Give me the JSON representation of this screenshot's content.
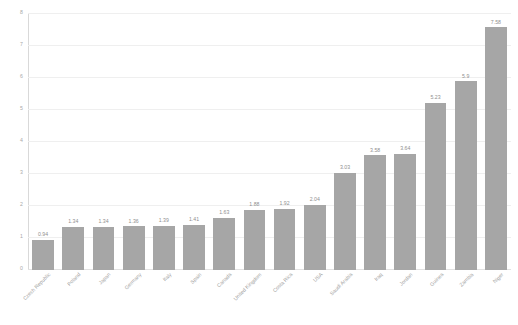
{
  "chart_data": {
    "type": "bar",
    "title": "",
    "subtitle": "",
    "xlabel": "",
    "ylabel": "",
    "ylim": [
      0,
      8
    ],
    "yticks": [
      "0",
      "1",
      "2",
      "3",
      "4",
      "5",
      "6",
      "7",
      "8"
    ],
    "grid": true,
    "legend": "none",
    "bar_color": "#a6a6a6",
    "categories": [
      "Czech Republic",
      "Poland",
      "Japan",
      "Germany",
      "Italy",
      "Spain",
      "Canada",
      "United Kingdom",
      "Costa Rica",
      "USA",
      "Saudi Arabia",
      "Iraq",
      "Jordan",
      "Guinea",
      "Zambia",
      "Niger"
    ],
    "values": [
      0.94,
      1.34,
      1.34,
      1.36,
      1.39,
      1.41,
      1.63,
      1.88,
      1.92,
      2.04,
      3.03,
      3.58,
      3.64,
      5.23,
      5.9,
      7.58
    ],
    "value_labels": [
      "0.94",
      "1.34",
      "1.34",
      "1.36",
      "1.39",
      "1.41",
      "1.63",
      "1.88",
      "1.92",
      "2.04",
      "3.03",
      "3.58",
      "3.64",
      "5.23",
      "5.9",
      "7.58"
    ]
  }
}
